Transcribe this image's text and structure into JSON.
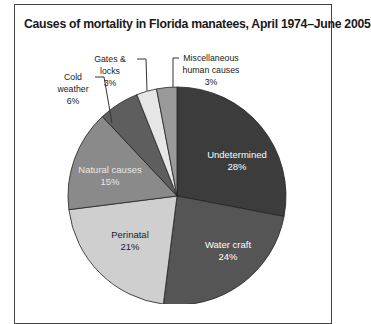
{
  "chart_data": {
    "type": "pie",
    "title": "Causes of mortality in Florida manatees, April 1974–June 2005",
    "categories": [
      "Undetermined",
      "Water craft",
      "Perinatal",
      "Natural causes",
      "Cold weather",
      "Gates & locks",
      "Miscellaneous human causes"
    ],
    "values": [
      28,
      24,
      21,
      15,
      6,
      3,
      3
    ],
    "unit": "%",
    "colors": [
      "#3c3c3c",
      "#555555",
      "#cfcfcf",
      "#8a8a8a",
      "#5e5e5e",
      "#e6e6e6",
      "#9a9a9a"
    ],
    "labels_inside": [
      "Undetermined",
      "Water craft",
      "Perinatal",
      "Natural causes"
    ],
    "labels_outside": [
      "Cold weather",
      "Gates & locks",
      "Miscellaneous human causes"
    ]
  },
  "title": "Causes of mortality in Florida manatees, April 1974–June 2005",
  "slices": {
    "undetermined": {
      "name": "Undetermined",
      "pct": "28%"
    },
    "watercraft": {
      "name": "Water craft",
      "pct": "24%"
    },
    "perinatal": {
      "name": "Perinatal",
      "pct": "21%"
    },
    "natural": {
      "name": "Natural causes",
      "pct": "15%"
    },
    "cold": {
      "name": "Cold weather",
      "pct": "6%"
    },
    "gates": {
      "name": "Gates & locks",
      "pct": "3%"
    },
    "misc": {
      "name_line1": "Miscellaneous",
      "name_line2": "human causes",
      "pct": "3%"
    }
  }
}
